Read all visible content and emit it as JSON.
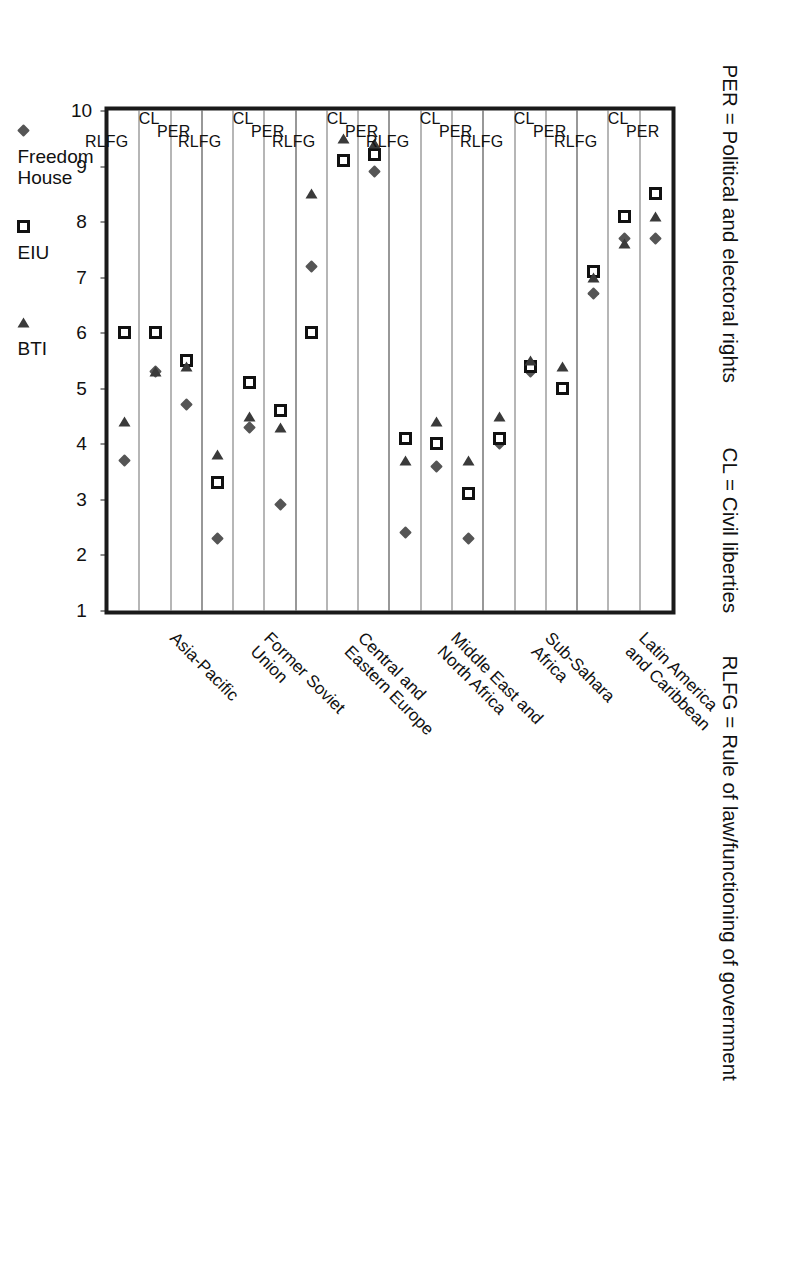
{
  "definitions": [
    {
      "key": "per",
      "text": "PER = Political and electoral rights"
    },
    {
      "key": "cl",
      "text": "CL = Civil liberties"
    },
    {
      "key": "rlfg",
      "text": "RLFG = Rule of law/functioning of government"
    }
  ],
  "legend": {
    "items": [
      {
        "label": "Freedom\nHouse",
        "marker": "diamond",
        "color": "#555555"
      },
      {
        "label": "EIU",
        "marker": "square",
        "color": "#111111"
      },
      {
        "label": "BTI",
        "marker": "triangle",
        "color": "#3a3a3a"
      }
    ]
  },
  "chart_data": {
    "type": "scatter",
    "title": "",
    "xlabel": "",
    "ylabel": "",
    "ylim": [
      10,
      1
    ],
    "grid": true,
    "legend_position": "bottom",
    "value_ticks": [
      "10",
      "9",
      "8",
      "7",
      "6",
      "5",
      "4",
      "3",
      "2",
      "1"
    ],
    "indicators": [
      "PER",
      "CL",
      "RLFG"
    ],
    "series": [
      "Freedom House",
      "EIU",
      "BTI"
    ],
    "groups": [
      {
        "region": "Latin America\nand Caribbean",
        "rows": [
          {
            "indicator": "PER",
            "Freedom House": 7.7,
            "EIU": 8.5,
            "BTI": 8.1
          },
          {
            "indicator": "CL",
            "Freedom House": 7.7,
            "EIU": 8.1,
            "BTI": 7.6
          },
          {
            "indicator": "RLFG",
            "Freedom House": 6.7,
            "EIU": 7.1,
            "BTI": 7.0
          }
        ]
      },
      {
        "region": "Sub-Sahara\nAfrica",
        "rows": [
          {
            "indicator": "PER",
            "Freedom House": null,
            "EIU": 5.0,
            "BTI": 5.4
          },
          {
            "indicator": "CL",
            "Freedom House": 5.3,
            "EIU": 5.4,
            "BTI": 5.5
          },
          {
            "indicator": "RLFG",
            "Freedom House": 4.0,
            "EIU": 4.1,
            "BTI": 4.5
          }
        ]
      },
      {
        "region": "Middle East and\nNorth Africa",
        "rows": [
          {
            "indicator": "PER",
            "Freedom House": 2.3,
            "EIU": 3.1,
            "BTI": 3.7
          },
          {
            "indicator": "CL",
            "Freedom House": 3.6,
            "EIU": 4.0,
            "BTI": 4.4
          },
          {
            "indicator": "RLFG",
            "Freedom House": 2.4,
            "EIU": 4.1,
            "BTI": 3.7
          }
        ]
      },
      {
        "region": "Central and\nEastern Europe",
        "rows": [
          {
            "indicator": "PER",
            "Freedom House": 8.9,
            "EIU": 9.2,
            "BTI": 9.4
          },
          {
            "indicator": "CL",
            "Freedom House": 9.1,
            "EIU": 9.1,
            "BTI": 9.5
          },
          {
            "indicator": "RLFG",
            "Freedom House": 7.2,
            "EIU": 6.0,
            "BTI": 8.5
          }
        ]
      },
      {
        "region": "Former Soviet\nUnion",
        "rows": [
          {
            "indicator": "PER",
            "Freedom House": 2.9,
            "EIU": 4.6,
            "BTI": 4.3
          },
          {
            "indicator": "CL",
            "Freedom House": 4.3,
            "EIU": 5.1,
            "BTI": 4.5
          },
          {
            "indicator": "RLFG",
            "Freedom House": 2.3,
            "EIU": 3.3,
            "BTI": 3.8
          }
        ]
      },
      {
        "region": "Asia-Pacific",
        "rows": [
          {
            "indicator": "PER",
            "Freedom House": 4.7,
            "EIU": 5.5,
            "BTI": 5.4
          },
          {
            "indicator": "CL",
            "Freedom House": 5.3,
            "EIU": 6.0,
            "BTI": 5.3
          },
          {
            "indicator": "RLFG",
            "Freedom House": 3.7,
            "EIU": 6.0,
            "BTI": 4.4
          }
        ]
      }
    ]
  }
}
